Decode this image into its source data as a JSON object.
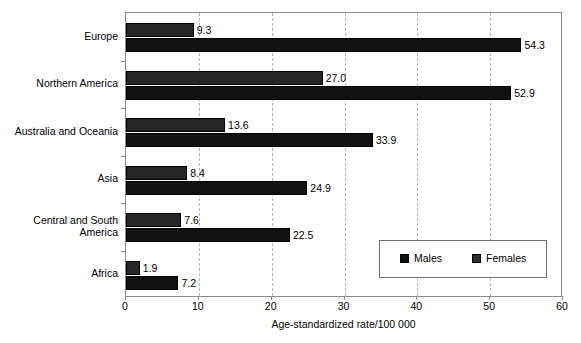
{
  "chart_data": {
    "type": "bar",
    "orientation": "horizontal",
    "title": "",
    "xlabel": "Age-standardized rate/100 000",
    "ylabel": "",
    "xlim": [
      0,
      60
    ],
    "xticks": [
      0,
      10,
      20,
      30,
      40,
      50,
      60
    ],
    "grid": true,
    "grid_axis": "x",
    "legend_position": "inside lower right",
    "categories": [
      "Europe",
      "Northern America",
      "Australia and Oceania",
      "Asia",
      "Central and South\nAmerica",
      "Africa"
    ],
    "series": [
      {
        "name": "Females",
        "color": "#262626",
        "values": [
          9.3,
          27.0,
          13.6,
          8.4,
          7.6,
          1.9
        ]
      },
      {
        "name": "Males",
        "color": "#111111",
        "values": [
          54.3,
          52.9,
          33.9,
          24.9,
          22.5,
          7.2
        ]
      }
    ],
    "data_labels": {
      "Females": [
        "9.3",
        "27.0",
        "13.6",
        "8.4",
        "7.6",
        "1.9"
      ],
      "Males": [
        "54.3",
        "52.9",
        "33.9",
        "24.9",
        "22.5",
        "7.2"
      ]
    }
  },
  "legend": {
    "items": [
      {
        "label": "Males",
        "color": "#111111"
      },
      {
        "label": "Females",
        "color": "#2e2e2e"
      }
    ]
  },
  "axis": {
    "x_tick_labels": [
      "0",
      "10",
      "20",
      "30",
      "40",
      "50",
      "60"
    ],
    "x_axis_title": "Age-standardized rate/100 000"
  }
}
